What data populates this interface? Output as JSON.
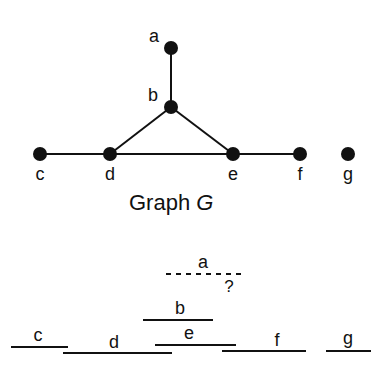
{
  "graph": {
    "caption": "Graph ",
    "caption_var": "G",
    "nodes": [
      {
        "id": "a",
        "label": "a",
        "x": 171,
        "y": 48,
        "lx": 154,
        "ly": 42
      },
      {
        "id": "b",
        "label": "b",
        "x": 171,
        "y": 107,
        "lx": 153,
        "ly": 101
      },
      {
        "id": "c",
        "label": "c",
        "x": 40,
        "y": 154,
        "lx": 40,
        "ly": 180
      },
      {
        "id": "d",
        "label": "d",
        "x": 110,
        "y": 154,
        "lx": 110,
        "ly": 180
      },
      {
        "id": "e",
        "label": "e",
        "x": 233,
        "y": 154,
        "lx": 233,
        "ly": 180
      },
      {
        "id": "f",
        "label": "f",
        "x": 300,
        "y": 154,
        "lx": 300,
        "ly": 180
      },
      {
        "id": "g",
        "label": "g",
        "x": 348,
        "y": 154,
        "lx": 348,
        "ly": 180
      }
    ],
    "edges": [
      [
        "a",
        "b"
      ],
      [
        "b",
        "d"
      ],
      [
        "b",
        "e"
      ],
      [
        "c",
        "d"
      ],
      [
        "d",
        "e"
      ],
      [
        "e",
        "f"
      ]
    ]
  },
  "intervals": {
    "items": [
      {
        "id": "a",
        "label": "a",
        "x1": 166,
        "x2": 241,
        "y": 274,
        "dashed": true,
        "lx": 203,
        "ly": 268
      },
      {
        "id": "b",
        "label": "b",
        "x1": 143,
        "x2": 213,
        "y": 320,
        "dashed": false,
        "lx": 180,
        "ly": 314
      },
      {
        "id": "c",
        "label": "c",
        "x1": 11,
        "x2": 68,
        "y": 347,
        "dashed": false,
        "lx": 38,
        "ly": 341
      },
      {
        "id": "d",
        "label": "d",
        "x1": 63,
        "x2": 172,
        "y": 353,
        "dashed": false,
        "lx": 114,
        "ly": 348
      },
      {
        "id": "e",
        "label": "e",
        "x1": 155,
        "x2": 236,
        "y": 345,
        "dashed": false,
        "lx": 189,
        "ly": 339
      },
      {
        "id": "f",
        "label": "f",
        "x1": 222,
        "x2": 306,
        "y": 351,
        "dashed": false,
        "lx": 277,
        "ly": 346
      },
      {
        "id": "g",
        "label": "g",
        "x1": 326,
        "x2": 371,
        "y": 351,
        "dashed": false,
        "lx": 348,
        "ly": 344
      }
    ],
    "question_mark": {
      "text": "?",
      "x": 229,
      "y": 292
    }
  },
  "colors": {
    "ink": "#111111",
    "background": "#ffffff"
  }
}
